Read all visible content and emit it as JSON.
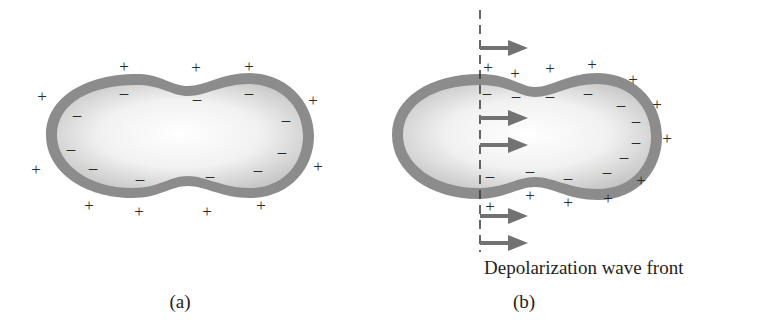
{
  "figure": {
    "panels": [
      {
        "id": "a",
        "label": "(a)",
        "description": "Polarized cell: positive charges outside membrane, negative charges inside"
      },
      {
        "id": "b",
        "label": "(b)",
        "description": "Depolarization wave front moving left to right across the cell",
        "caption": "Depolarization wave front",
        "arrow_count": 5
      }
    ],
    "colors": {
      "membrane": "#8a8a8a",
      "cytoplasm_center": "#ffffff",
      "cytoplasm_edge": "#c9c9c9",
      "arrow": "#707070",
      "dashed_line": "#333333",
      "sign": "#2a2a2a"
    },
    "symbols": {
      "positive": "+",
      "negative": "–"
    }
  }
}
